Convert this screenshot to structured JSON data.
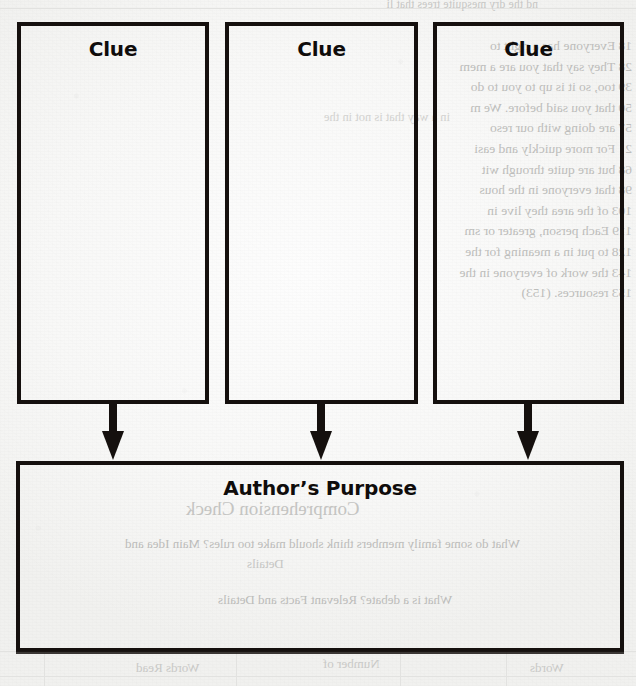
{
  "page": {
    "type": "graphic-organizer-worksheet",
    "width": 636,
    "height": 686,
    "ink_color": "#15100e",
    "paper_color": "#f8f8f7",
    "bleed_text_color": "#bdbdbb"
  },
  "organizer": {
    "clue_boxes": [
      {
        "label": "Clue"
      },
      {
        "label": "Clue"
      },
      {
        "label": "Clue"
      }
    ],
    "arrows": [
      {
        "direction": "down"
      },
      {
        "direction": "down"
      },
      {
        "direction": "down"
      }
    ],
    "conclusion_box": {
      "label": "Author’s Purpose"
    }
  },
  "show_through": {
    "note": "faint mirrored text bleeding through from the reverse side of the page",
    "top_strip": "nd the dry mesquite trees that li",
    "right_column": "18 Everyone has a right to\n28 They say that you are a mem\n39 too, so it is up to you to do\n50 that you said before. We m\n57 are doing with our reso\n2   For more quickly and easi\n68 but are quite through wit\n98 that everyone in the hous\n103 of the area they live in\n119 Each person, greater or sm\n128 to put in a meaning for the\n143 the work of everyone in the\n153 resources. (153)",
    "mid_line": "in a way that is not in the",
    "comprehension_heading": "Comprehension Check",
    "comprehension_q1": "What do some family members think should make too rules? Main Idea and",
    "comprehension_sub1": "Details",
    "comprehension_q2": "What is a debate? Relevant Facts and Details",
    "table_headers": [
      "Words Read",
      "Number of",
      "Words"
    ]
  }
}
